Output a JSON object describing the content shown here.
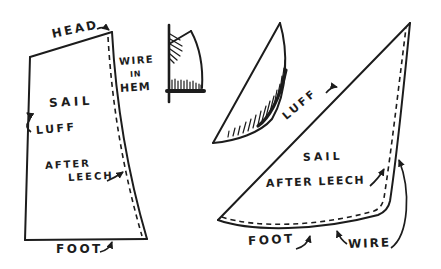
{
  "diagram": {
    "background_color": "#ffffff",
    "ink_color": "#1c1c1c",
    "flat_sail": {
      "head_label": "HEAD",
      "sail_label": "SAIL",
      "luff_label": "LUFF",
      "after_leech_line1": "AFTER",
      "after_leech_line2": "LEECH",
      "foot_label": "FOOT"
    },
    "hem_detail": {
      "caption_line1": "WIRE",
      "caption_line2": "IN",
      "caption_line3": "HEM"
    },
    "curved_sail": {
      "luff_label": "LUFF",
      "sail_label": "SAIL",
      "after_leech_label": "AFTER LEECH",
      "foot_label": "FOOT",
      "wire_label": "WIRE"
    }
  }
}
